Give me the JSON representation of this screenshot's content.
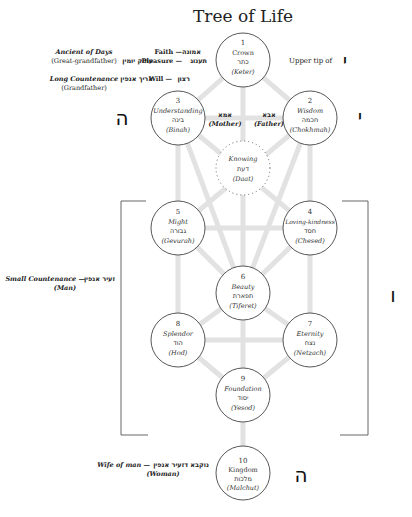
{
  "title": "Tree of Life",
  "sefirot": [
    {
      "id": "keter",
      "number": "1",
      "name": "Crown",
      "hebrew": "כתר",
      "translit": "(Keter)",
      "cx": 243,
      "cy": 60
    },
    {
      "id": "chokhmah",
      "number": "2",
      "name": "Wisdom",
      "hebrew": "חכמה",
      "translit": "(Chokhmah)",
      "cx": 310,
      "cy": 118
    },
    {
      "id": "binah",
      "number": "3",
      "name": "Understanding",
      "hebrew": "בינה",
      "translit": "(Binah)",
      "cx": 178,
      "cy": 118
    },
    {
      "id": "daat",
      "number": "",
      "name": "Knowing",
      "hebrew": "דעת",
      "translit": "(Daat)",
      "cx": 243,
      "cy": 168,
      "dotted": true
    },
    {
      "id": "chesed",
      "number": "4",
      "name": "Loving-kindness",
      "hebrew": "חסד",
      "translit": "(Chesed)",
      "cx": 310,
      "cy": 228
    },
    {
      "id": "gevurah",
      "number": "5",
      "name": "Might",
      "hebrew": "גבורה",
      "translit": "(Gevurah)",
      "cx": 178,
      "cy": 228
    },
    {
      "id": "tiferet",
      "number": "6",
      "name": "Beauty",
      "hebrew": "תפארת",
      "translit": "(Tiferet)",
      "cx": 243,
      "cy": 293
    },
    {
      "id": "netzach",
      "number": "7",
      "name": "Eternity",
      "hebrew": "נצח",
      "translit": "(Netzach)",
      "cx": 310,
      "cy": 340
    },
    {
      "id": "hod",
      "number": "8",
      "name": "Splendor",
      "hebrew": "הוד",
      "translit": "(Hod)",
      "cx": 178,
      "cy": 340
    },
    {
      "id": "yesod",
      "number": "9",
      "name": "Foundation",
      "hebrew": "יסוד",
      "translit": "(Yesod)",
      "cx": 243,
      "cy": 395
    },
    {
      "id": "malchut",
      "number": "10",
      "name": "Kingdom",
      "hebrew": "מלכות",
      "translit": "(Malchut)",
      "cx": 243,
      "cy": 473
    }
  ],
  "parents": {
    "mother_hebrew": "אמא",
    "mother_label": "(Mother)",
    "father_hebrew": "אבא",
    "father_label": "(Father)"
  },
  "keter_labels": {
    "faith": "Faith —",
    "faith_hebrew": "אמונה",
    "pleasure": "Pleasure —",
    "pleasure_hebrew": "תענוג",
    "pleasure_partzuf_hebrew": "עתיק יומין",
    "will": "Will —",
    "will_hebrew": "רצון",
    "will_partzuf_hebrew": "אריך אנפין",
    "ancient_of_days": "Ancient of Days",
    "great_grandfather": "(Great-grandfather)",
    "long_countenance": "Long Countenance",
    "grandfather": "(Grandfather)",
    "upper_tip": "Upper tip of"
  },
  "partzufim": {
    "small_countenance": "Small  Countenance —",
    "small_countenance_hebrew": "זעיר אנפין",
    "man": "(Man)",
    "wife_of_man": "Wife of man —",
    "wife_of_man_hebrew": "נוקבא דזעיר אנפין",
    "woman": "(Woman)"
  },
  "tetragrammaton": {
    "yud_upper": "י",
    "yud": "י",
    "heh_upper": "ה",
    "vav": "ו",
    "heh_lower": "ה"
  }
}
